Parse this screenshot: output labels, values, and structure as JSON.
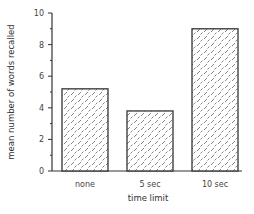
{
  "chart_data": {
    "type": "bar",
    "title": "",
    "xlabel": "time limit",
    "ylabel": "mean number of words recalled",
    "categories": [
      "none",
      "5 sec",
      "10 sec"
    ],
    "values": [
      5.2,
      3.8,
      9.0
    ],
    "ylim": [
      0,
      10
    ],
    "yticks": [
      0,
      2,
      4,
      6,
      8,
      10
    ],
    "yticks_minor": [
      1,
      3,
      5,
      7,
      9
    ],
    "grid": false,
    "legend": null,
    "bar_fill": "hatched diamond pattern",
    "colors": {
      "bar_edge": "#333333",
      "hatch": "#666666",
      "axis": "#333333",
      "background": "#ffffff"
    }
  }
}
